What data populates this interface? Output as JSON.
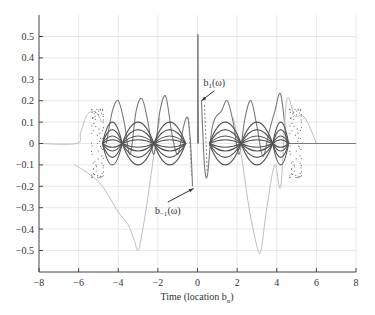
{
  "chart_data": {
    "type": "line",
    "title": "",
    "xlabel": "Time (location b_n)",
    "xlabel_main": "Time (location b",
    "xlabel_sub": "n",
    "xlabel_close": ")",
    "ylabel": "",
    "xlim": [
      -8,
      8
    ],
    "ylim": [
      -0.6,
      0.58
    ],
    "grid": true,
    "x_ticks": [
      -8,
      -6,
      -4,
      -2,
      0,
      2,
      4,
      6,
      8
    ],
    "x_tick_labels": [
      "−8",
      "−6",
      "−4",
      "−2",
      "0",
      "2",
      "4",
      "6",
      "8"
    ],
    "y_ticks": [
      0.5,
      0.4,
      0.3,
      0.2,
      0.1,
      0,
      -0.1,
      -0.2,
      -0.3,
      -0.4,
      -0.5
    ],
    "y_tick_labels": [
      "0.5",
      "0.4",
      "0.3",
      "0.2",
      "0.1",
      "0",
      "−0.1",
      "−0.2",
      "−0.3",
      "−0.4",
      "−0.5"
    ],
    "annotations": [
      {
        "text_main": "b",
        "text_sub": "1",
        "text_tail": "(ω)",
        "label_x": 0.85,
        "label_y": 0.27,
        "arrow_to_x": 0.2,
        "arrow_to_y": 0.2
      },
      {
        "text_main": "b",
        "text_sub": "−1",
        "text_tail": "(ω)",
        "label_x": -1.5,
        "label_y": -0.33,
        "arrow_to_x": -0.2,
        "arrow_to_y": -0.21
      }
    ],
    "series": [
      {
        "name": "baseline (outer envelope, light)",
        "style": "light",
        "x": [
          -8,
          -6.1,
          -5.9,
          -5.6,
          -5.3,
          -5.05,
          -4.85
        ],
        "y": [
          0,
          0,
          0.05,
          0.13,
          0.15,
          0.14,
          0.1
        ]
      },
      {
        "name": "large light lobe negative",
        "style": "light",
        "x": [
          -6.2,
          -5.5,
          -4.8,
          -4.0,
          -3.5,
          -3.2,
          -3.0,
          -2.8,
          -2.5,
          -2.2,
          -1.9
        ],
        "y": [
          -0.1,
          -0.14,
          -0.2,
          -0.32,
          -0.38,
          -0.45,
          -0.5,
          -0.42,
          -0.25,
          -0.05,
          0.12
        ]
      },
      {
        "name": "oscillating envelope (medium gray)",
        "style": "medium",
        "x": [
          -4.6,
          -4.3,
          -4.0,
          -3.7,
          -3.4,
          -3.1,
          -2.8,
          -2.5,
          -2.2,
          -1.9,
          -1.6,
          -1.3,
          -1.0,
          -0.7,
          -0.5,
          -0.35,
          -0.25
        ],
        "y": [
          0.0,
          0.15,
          0.2,
          0.1,
          -0.05,
          0.15,
          0.21,
          0.1,
          -0.05,
          0.15,
          0.22,
          0.05,
          -0.05,
          0.08,
          0.12,
          0.0,
          -0.2
        ]
      },
      {
        "name": "b1 right oscillation",
        "style": "medium",
        "x": [
          0.2,
          0.35,
          0.5,
          0.7,
          0.9,
          1.2,
          1.5,
          1.8,
          2.1,
          2.4,
          2.7,
          3.0,
          3.3,
          3.6,
          3.9,
          4.2,
          4.5
        ],
        "y": [
          0.2,
          -0.1,
          -0.15,
          0.05,
          0.12,
          0.15,
          0.2,
          0.1,
          -0.05,
          0.12,
          0.2,
          0.08,
          -0.06,
          0.05,
          0.15,
          0.23,
          0.0
        ]
      },
      {
        "name": "right light lobe",
        "style": "light",
        "x": [
          1.8,
          2.2,
          2.6,
          3.0,
          3.2,
          3.5,
          3.9,
          4.2,
          4.5,
          4.9,
          5.3,
          5.6,
          6.0
        ],
        "y": [
          0.12,
          -0.05,
          -0.3,
          -0.48,
          -0.5,
          -0.3,
          -0.1,
          -0.2,
          0.2,
          0.13,
          0.13,
          0.09,
          0
        ]
      },
      {
        "name": "baseline right",
        "style": "medium",
        "x": [
          4.5,
          8
        ],
        "y": [
          0,
          0
        ]
      }
    ]
  }
}
